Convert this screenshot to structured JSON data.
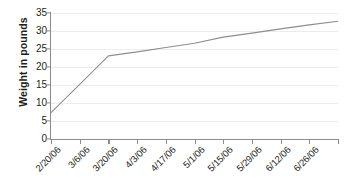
{
  "chart_data": {
    "type": "line",
    "title": "",
    "xlabel": "",
    "ylabel": "Weight in pounds",
    "x": [
      "2/20/06",
      "3/6/06",
      "3/20/06",
      "4/3/06",
      "4/17/06",
      "5/1/06",
      "5/15/06",
      "5/29/06",
      "6/12/06",
      "6/26/06"
    ],
    "categories": [
      "2/20/06",
      "3/6/06",
      "3/20/06",
      "4/3/06",
      "4/17/06",
      "5/1/06",
      "5/15/06",
      "5/29/06",
      "6/12/06",
      "6/26/06"
    ],
    "values": [
      7.3,
      15.2,
      23.1,
      24.2,
      25.4,
      26.6,
      28.3,
      29.4,
      30.6,
      31.7
    ],
    "series": [
      {
        "name": "Weight",
        "values": [
          7.3,
          15.2,
          23.1,
          24.2,
          25.4,
          26.6,
          28.3,
          29.4,
          30.6,
          31.7
        ]
      }
    ],
    "end_value": 32.7,
    "ylim": [
      0,
      35
    ],
    "ytick_values": [
      0,
      5,
      10,
      15,
      20,
      25,
      30,
      35
    ],
    "ytick_labels": [
      "0",
      "5",
      "10",
      "15",
      "20",
      "25",
      "30",
      "35"
    ],
    "xtick_labels": [
      "2/20/06",
      "3/6/06",
      "3/20/06",
      "4/3/06",
      "4/17/06",
      "5/1/06",
      "5/15/06",
      "5/29/06",
      "6/12/06",
      "6/26/06"
    ],
    "xtick_count": 11,
    "grid": "horizontal",
    "legend": "none",
    "line_color": "#8e8e90",
    "grid_color": "#ececed",
    "axis_color": "#8c8c8e",
    "text_color": "#231f20",
    "background_color": "#ffffff"
  }
}
